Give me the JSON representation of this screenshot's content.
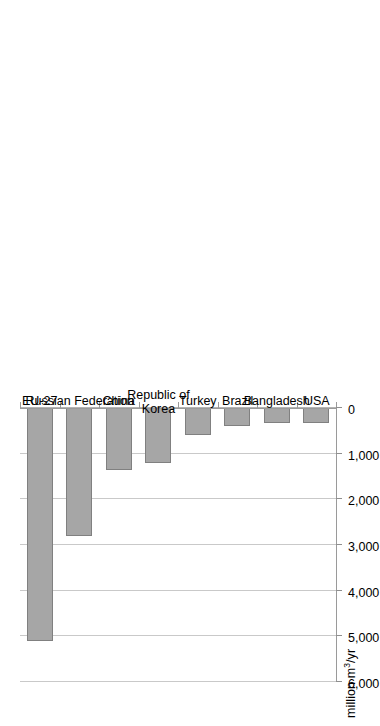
{
  "chart_data": {
    "type": "bar",
    "orientation": "horizontal",
    "title": "",
    "xlabel": "million m³/yr",
    "ylabel": "",
    "axis_title": "million m³/yr",
    "categories": [
      "EU-27",
      "Russian Federation",
      "China",
      "Republic of\nKorea",
      "Turkey",
      "Brazil",
      "Bangladesh",
      "USA"
    ],
    "values": [
      5100,
      2800,
      1360,
      1200,
      590,
      390,
      330,
      330
    ],
    "tick_labels": [
      "6,000",
      "5,000",
      "4,000",
      "3,000",
      "2,000",
      "1,000",
      "0"
    ],
    "tick_values": [
      6000,
      5000,
      4000,
      3000,
      2000,
      1000,
      0
    ],
    "xlim": [
      6000,
      0
    ],
    "axis_reversed": true,
    "grid": true,
    "legend": false,
    "bar_color": "#a6a6a6",
    "bar_edge_color": "#808080",
    "gridline_color": "#c9c9c9",
    "axis_color": "#9a9a9a",
    "background": "#ffffff",
    "rotated_layout_degrees": -90
  },
  "axis": {
    "title_prefix": "million m",
    "title_exponent": "3",
    "title_suffix": "/yr"
  }
}
